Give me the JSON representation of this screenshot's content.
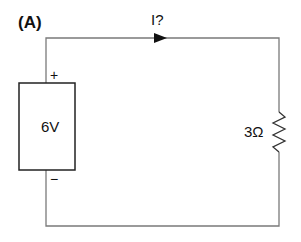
{
  "figure": {
    "panel_label": "(A)",
    "current_label": "I?",
    "source": {
      "label": "6V",
      "positive_sign": "+",
      "negative_sign": "−"
    },
    "resistor": {
      "label": "3Ω"
    }
  }
}
